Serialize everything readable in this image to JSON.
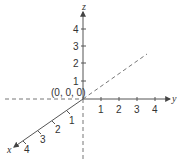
{
  "diagram": {
    "origin_label": "(0, 0, 0)",
    "axes": {
      "x": {
        "label": "x",
        "ticks": [
          "1",
          "2",
          "3",
          "4"
        ]
      },
      "y": {
        "label": "y",
        "ticks": [
          "1",
          "2",
          "3",
          "4"
        ]
      },
      "z": {
        "label": "z",
        "ticks": [
          "1",
          "2",
          "3",
          "4"
        ]
      }
    },
    "colors": {
      "axis": "#555555",
      "dashed": "#777777",
      "text": "#333333"
    }
  }
}
